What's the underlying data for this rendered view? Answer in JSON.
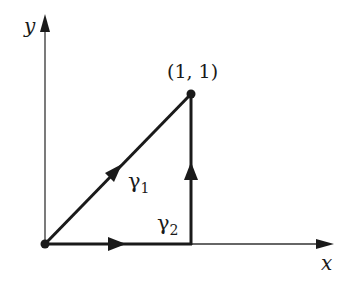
{
  "diagram": {
    "type": "path-integral-contours",
    "axes": {
      "x_label": "x",
      "y_label": "y"
    },
    "points": [
      {
        "name": "origin",
        "coords": [
          0,
          0
        ]
      },
      {
        "name": "endpoint",
        "coords": [
          1,
          1
        ],
        "label": "(1, 1)"
      }
    ],
    "curves": [
      {
        "name": "gamma1",
        "label_base": "γ",
        "label_sub": "1",
        "description": "straight line from (0,0) to (1,1)",
        "direction": "toward (1,1)"
      },
      {
        "name": "gamma2",
        "label_base": "γ",
        "label_sub": "2",
        "description": "along x-axis from (0,0) to (1,0), then vertically to (1,1)",
        "direction": "toward (1,1)"
      }
    ],
    "colors": {
      "stroke": "#1a1a1a",
      "axis": "#333333",
      "background": "#ffffff"
    }
  }
}
